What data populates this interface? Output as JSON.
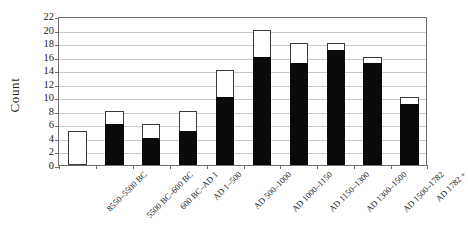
{
  "chart_data": {
    "type": "bar",
    "title": "",
    "subtitle": "",
    "xlabel": "",
    "ylabel": "Count",
    "ylim": [
      0,
      22
    ],
    "yticks": [
      0,
      2,
      4,
      6,
      8,
      10,
      12,
      14,
      16,
      18,
      20,
      22
    ],
    "grid": true,
    "legend": "none",
    "stacked": true,
    "bar_style": "stacked black bottom segment with white/open top segment, thin dark outline",
    "categories": [
      "8550–5500 BC",
      "5500 BC–600 BC",
      "600 BC–AD 1",
      "AD 1–500",
      "AD 500–1000",
      "AD 1000–1150",
      "AD 1150–1300",
      "AD 1300–1500",
      "AD 1500–1782",
      "AD 1782 +"
    ],
    "series": [
      {
        "name": "filled",
        "color": "#0a0a0a",
        "values": [
          0,
          6,
          4,
          5,
          10,
          16,
          15,
          17,
          15,
          9
        ]
      },
      {
        "name": "open",
        "color": "#ffffff",
        "values": [
          5,
          2,
          2,
          3,
          4,
          4,
          3,
          1,
          1,
          1
        ]
      }
    ],
    "totals": [
      5,
      8,
      6,
      8,
      14,
      20,
      18,
      18,
      16,
      10
    ]
  },
  "axes": {
    "y_title": "Count",
    "y_tick_labels": [
      "22",
      "20",
      "18",
      "16",
      "14",
      "12",
      "10",
      "8",
      "6",
      "4",
      "2",
      "0"
    ],
    "x_tick_labels": [
      "8550–5500 BC",
      "5500 BC–600 BC",
      "600 BC–AD 1",
      "AD 1–500",
      "AD 500–1000",
      "AD 1000–1150",
      "AD 1150–1300",
      "AD 1300–1500",
      "AD 1500–1782",
      "AD 1782 +"
    ]
  },
  "colors": {
    "filled_segment": "#0a0a0a",
    "open_segment": "#ffffff",
    "outline": "#3a3a3a",
    "gridline": "#c9c9c9",
    "axis": "#6d6d6d",
    "background": "#ffffff",
    "text": "#1a1a1a"
  }
}
